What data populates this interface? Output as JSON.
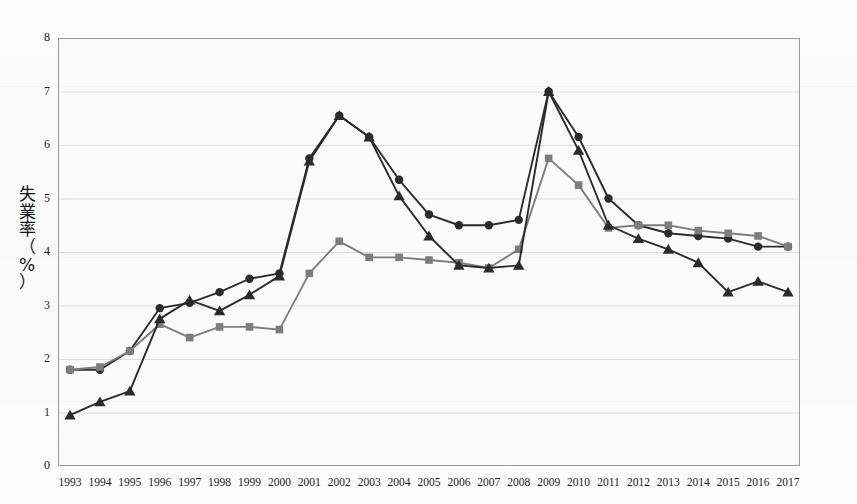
{
  "figure": {
    "background_color": "#fdfdfd",
    "plot_background_color": "#fbfbfb",
    "plot_border_color": "#9a9a9a",
    "gridline_color": "#d8d8d8"
  },
  "axes": {
    "y_axis_label_chars": [
      "失",
      "業",
      "率",
      "（",
      "%",
      "）"
    ],
    "y_axis_label": "失業率（%）",
    "y_ticks": [
      "0",
      "1",
      "2",
      "3",
      "4",
      "5",
      "6",
      "7",
      "8"
    ],
    "y_min": 0,
    "y_max": 8,
    "x_ticks": [
      "1993",
      "1994",
      "1995",
      "1996",
      "1997",
      "1998",
      "1999",
      "2000",
      "2001",
      "2002",
      "2003",
      "2004",
      "2005",
      "2006",
      "2007",
      "2008",
      "2009",
      "2010",
      "2011",
      "2012",
      "2013",
      "2014",
      "2015",
      "2016",
      "2017"
    ]
  },
  "series_colors": {
    "circle": "#2b2b2b",
    "square": "#7d7d7d",
    "triangle": "#2b2b2b"
  },
  "chart_data": {
    "type": "line",
    "title": "",
    "xlabel": "",
    "ylabel": "失業率（%）",
    "ylim": [
      0,
      8
    ],
    "grid": true,
    "legend_position": "none",
    "x": [
      "1993",
      "1994",
      "1995",
      "1996",
      "1997",
      "1998",
      "1999",
      "2000",
      "2001",
      "2002",
      "2003",
      "2004",
      "2005",
      "2006",
      "2007",
      "2008",
      "2009",
      "2010",
      "2011",
      "2012",
      "2013",
      "2014",
      "2015",
      "2016",
      "2017"
    ],
    "series": [
      {
        "name": "circle-series",
        "marker": "circle",
        "color": "#2b2b2b",
        "values": [
          1.8,
          1.8,
          2.15,
          2.95,
          3.05,
          3.25,
          3.5,
          3.6,
          5.75,
          6.55,
          6.15,
          5.35,
          4.7,
          4.5,
          4.5,
          4.6,
          7.0,
          6.15,
          5.0,
          4.5,
          4.35,
          4.3,
          4.25,
          4.1,
          4.1
        ]
      },
      {
        "name": "square-series",
        "marker": "square",
        "color": "#7d7d7d",
        "values": [
          1.8,
          1.85,
          2.15,
          2.65,
          2.4,
          2.6,
          2.6,
          2.55,
          3.6,
          4.2,
          3.9,
          3.9,
          3.85,
          3.8,
          3.7,
          4.05,
          5.75,
          5.25,
          4.45,
          4.5,
          4.5,
          4.4,
          4.35,
          4.3,
          4.1
        ]
      },
      {
        "name": "triangle-series",
        "marker": "triangle",
        "color": "#2b2b2b",
        "values": [
          0.95,
          1.2,
          1.4,
          2.75,
          3.1,
          2.9,
          3.2,
          3.55,
          5.7,
          6.55,
          6.15,
          5.05,
          4.3,
          3.75,
          3.7,
          3.75,
          7.0,
          5.9,
          4.5,
          4.25,
          4.05,
          3.8,
          3.25,
          3.45,
          3.25
        ]
      }
    ]
  }
}
